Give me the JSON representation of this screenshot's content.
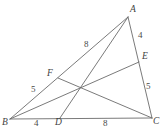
{
  "figure": {
    "stroke_color": "#6b6b6b",
    "label_color": "#4a4a4a",
    "background": "#ffffff"
  },
  "vertices": [
    {
      "id": "A",
      "label": "A",
      "x": 128,
      "y": 17
    },
    {
      "id": "B",
      "label": "B",
      "x": 10,
      "y": 119
    },
    {
      "id": "C",
      "label": "C",
      "x": 152,
      "y": 118
    }
  ],
  "points": [
    {
      "id": "D",
      "label": "D",
      "x": 60,
      "y": 118,
      "on": "BC"
    },
    {
      "id": "E",
      "label": "E",
      "x": 139,
      "y": 62,
      "on": "AC"
    },
    {
      "id": "F",
      "label": "F",
      "x": 58,
      "y": 78,
      "on": "AB"
    }
  ],
  "vertex_labels": [
    {
      "name": "A",
      "text": "A",
      "left": 130,
      "top": 5
    },
    {
      "name": "B",
      "text": "B",
      "left": 2,
      "top": 118
    },
    {
      "name": "C",
      "text": "C",
      "left": 153,
      "top": 117
    },
    {
      "name": "D",
      "text": "D",
      "left": 55,
      "top": 118
    },
    {
      "name": "E",
      "text": "E",
      "left": 142,
      "top": 52
    },
    {
      "name": "F",
      "text": "F",
      "left": 47,
      "top": 69
    }
  ],
  "length_labels": [
    {
      "name": "AF",
      "text": "8",
      "segment": "A-F",
      "left": 84,
      "top": 40
    },
    {
      "name": "FB",
      "text": "5",
      "segment": "F-B",
      "left": 31,
      "top": 85
    },
    {
      "name": "AE",
      "text": "4",
      "segment": "A-E",
      "left": 138,
      "top": 31
    },
    {
      "name": "EC",
      "text": "5",
      "segment": "E-C",
      "left": 146,
      "top": 82
    },
    {
      "name": "BD",
      "text": "4",
      "segment": "B-D",
      "left": 34,
      "top": 119
    },
    {
      "name": "DC",
      "text": "8",
      "segment": "D-C",
      "left": 103,
      "top": 119
    }
  ],
  "segments": [
    {
      "name": "side-AB",
      "from": "A",
      "to": "B"
    },
    {
      "name": "side-BC",
      "from": "B",
      "to": "C"
    },
    {
      "name": "side-CA",
      "from": "C",
      "to": "A"
    },
    {
      "name": "cevian-AD",
      "from": "A",
      "to": "D"
    },
    {
      "name": "cevian-BE",
      "from": "B",
      "to": "E"
    },
    {
      "name": "cevian-CF",
      "from": "C",
      "to": "F"
    }
  ],
  "intersection": {
    "name": "cevian-intersection",
    "x": 79,
    "y": 89
  }
}
